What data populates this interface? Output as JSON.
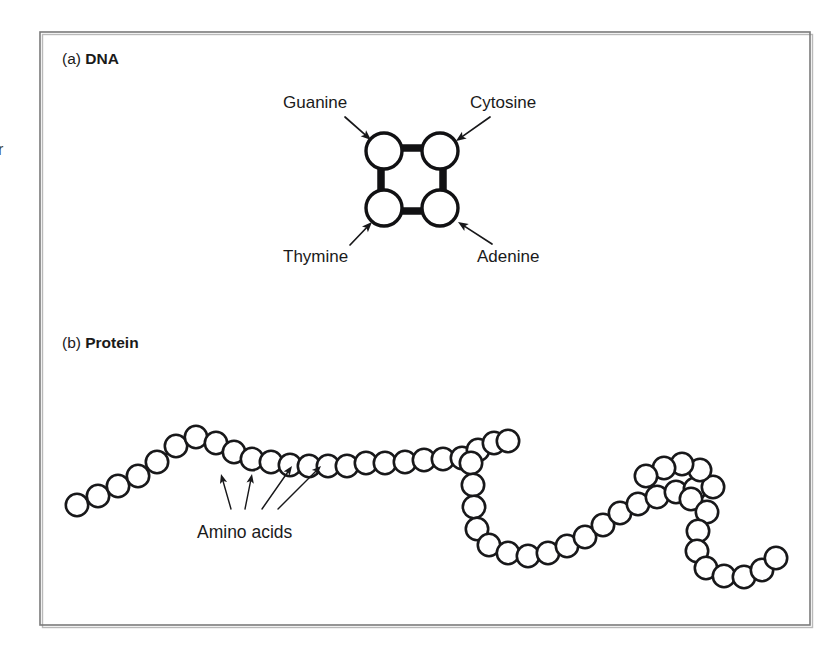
{
  "figure": {
    "panels": [
      {
        "id": "a",
        "marker": "(a)",
        "title": "DNA"
      },
      {
        "id": "b",
        "marker": "(b)",
        "title": "Protein"
      }
    ],
    "dna": {
      "bases": [
        {
          "name": "Guanine",
          "position": "top-left",
          "cx": 384,
          "cy": 151,
          "r": 18,
          "label_x": 283,
          "label_y": 108,
          "anchor": "start",
          "arrow_from_x": 345,
          "arrow_from_y": 117,
          "arrow_to_x": 371,
          "arrow_to_y": 140
        },
        {
          "name": "Cytosine",
          "position": "top-right",
          "cx": 440,
          "cy": 151,
          "r": 18,
          "label_x": 470,
          "label_y": 108,
          "anchor": "start",
          "arrow_from_x": 490,
          "arrow_from_y": 117,
          "arrow_to_x": 456,
          "arrow_to_y": 141
        },
        {
          "name": "Thymine",
          "position": "bottom-left",
          "cx": 384,
          "cy": 208,
          "r": 18,
          "label_x": 283,
          "label_y": 262,
          "anchor": "start",
          "arrow_from_x": 350,
          "arrow_from_y": 245,
          "arrow_to_x": 372,
          "arrow_to_y": 222
        },
        {
          "name": "Adenine",
          "position": "bottom-right",
          "cx": 440,
          "cy": 208,
          "r": 18,
          "label_x": 477,
          "label_y": 262,
          "anchor": "start",
          "arrow_from_x": 492,
          "arrow_from_y": 244,
          "arrow_to_x": 458,
          "arrow_to_y": 222
        }
      ],
      "bonds": [
        {
          "pair": "Guanine-Cytosine",
          "x1": 402,
          "y1": 148,
          "x2": 422,
          "y2": 148
        },
        {
          "pair": "Thymine-Adenine",
          "x1": 402,
          "y1": 211,
          "x2": 422,
          "y2": 211
        },
        {
          "pair": "Guanine-Thymine",
          "x1": 381,
          "y1": 169,
          "x2": 381,
          "y2": 190
        },
        {
          "pair": "Cytosine-Adenine",
          "x1": 443,
          "y1": 169,
          "x2": 443,
          "y2": 190
        }
      ]
    },
    "protein": {
      "amino_acids_label": "Amino acids",
      "label_x": 197,
      "label_y": 538,
      "bead_radius": 11.2,
      "bead_count": 54,
      "beads": [
        [
          77,
          505
        ],
        [
          98,
          496
        ],
        [
          118,
          486
        ],
        [
          138,
          476
        ],
        [
          157,
          462
        ],
        [
          176,
          446
        ],
        [
          196,
          437
        ],
        [
          216,
          443
        ],
        [
          234,
          452
        ],
        [
          252,
          459
        ],
        [
          271,
          462
        ],
        [
          290,
          465
        ],
        [
          309,
          466
        ],
        [
          328,
          466
        ],
        [
          347,
          466
        ],
        [
          366,
          463
        ],
        [
          385,
          463
        ],
        [
          405,
          462
        ],
        [
          424,
          460
        ],
        [
          443,
          459
        ],
        [
          462,
          458
        ],
        [
          478,
          450
        ],
        [
          494,
          443
        ],
        [
          508,
          441
        ],
        [
          471,
          463
        ],
        [
          473,
          485
        ],
        [
          474,
          507
        ],
        [
          477,
          529
        ],
        [
          489,
          545
        ],
        [
          508,
          553
        ],
        [
          528,
          556
        ],
        [
          548,
          553
        ],
        [
          567,
          546
        ],
        [
          585,
          537
        ],
        [
          603,
          525
        ],
        [
          620,
          513
        ],
        [
          638,
          504
        ],
        [
          657,
          497
        ],
        [
          676,
          492
        ],
        [
          695,
          489
        ],
        [
          713,
          487
        ],
        [
          691,
          499
        ],
        [
          707,
          512
        ],
        [
          698,
          531
        ],
        [
          697,
          551
        ],
        [
          706,
          568
        ],
        [
          724,
          576
        ],
        [
          744,
          577
        ],
        [
          762,
          570
        ],
        [
          776,
          558
        ],
        [
          700,
          470
        ],
        [
          682,
          464
        ],
        [
          664,
          468
        ],
        [
          646,
          476
        ]
      ],
      "arrows": [
        {
          "from_x": 231,
          "from_y": 509,
          "to_x": 221,
          "to_y": 474,
          "target_bead": 10
        },
        {
          "from_x": 245,
          "from_y": 509,
          "to_x": 252,
          "to_y": 474,
          "target_bead": 9
        },
        {
          "from_x": 262,
          "from_y": 509,
          "to_x": 292,
          "to_y": 466,
          "target_bead": 12
        },
        {
          "from_x": 278,
          "from_y": 509,
          "to_x": 321,
          "to_y": 466,
          "target_bead": 14
        }
      ]
    },
    "frame": {
      "x": 40,
      "y": 32,
      "width": 770,
      "height": 593
    },
    "edge_artifact": {
      "text": "r",
      "x": -2,
      "y": 155
    }
  }
}
